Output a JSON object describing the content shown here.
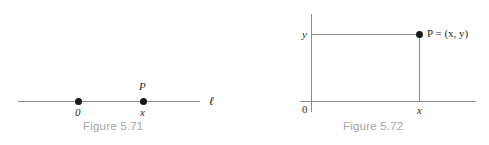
{
  "figures": [
    {
      "id": "number-line",
      "caption": "Figure 5.71",
      "line_label": "ℓ",
      "origin_label": "0",
      "point_label": "P",
      "coordinate_label": "x",
      "line_color": "#8c8c8c",
      "dot_color": "#1a1a1a",
      "caption_color": "#a5a5a5"
    },
    {
      "id": "coordinate-plane",
      "caption": "Figure 5.72",
      "origin_label": "0",
      "x_axis_label": "x",
      "y_axis_label": "y",
      "point_label": "P = (x, y)",
      "line_color": "#8c8c8c",
      "dot_color": "#1a1a1a",
      "caption_color": "#a5a5a5"
    }
  ],
  "chart_data": [
    {
      "type": "line",
      "title": "Figure 5.71",
      "description": "A real number line ℓ with origin 0 and a point P at coordinate x.",
      "xlabel": "ℓ",
      "ylabel": "",
      "points": [
        {
          "name": "0",
          "x": 0,
          "y": 0
        },
        {
          "name": "P",
          "x": 1,
          "y": 0
        }
      ],
      "annotations": [
        "0",
        "P",
        "x",
        "ℓ"
      ],
      "grid": false,
      "legend": "none"
    },
    {
      "type": "scatter",
      "title": "Figure 5.72",
      "description": "A Cartesian coordinate plane showing point P = (x, y) with dashed guide lines to both axes.",
      "xlabel": "x",
      "ylabel": "y",
      "points": [
        {
          "name": "P = (x, y)",
          "x": 1,
          "y": 1
        }
      ],
      "annotations": [
        "0",
        "x",
        "y",
        "P = (x, y)"
      ],
      "grid": false,
      "legend": "none"
    }
  ]
}
